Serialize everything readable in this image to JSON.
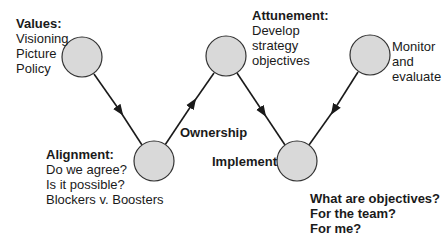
{
  "diagram": {
    "nodes": [
      {
        "id": "values",
        "title": "Values:",
        "lines": [
          "Visioning",
          "Picture",
          "Policy"
        ]
      },
      {
        "id": "alignment",
        "title": "Alignment:",
        "lines": [
          "Do we agree?",
          "Is it possible?",
          "Blockers v. Boosters"
        ]
      },
      {
        "id": "attunement",
        "title": "Attunement:",
        "lines": [
          "Develop",
          "strategy",
          "objectives"
        ]
      },
      {
        "id": "implement",
        "title": "Implement",
        "lines": []
      },
      {
        "id": "monitor",
        "title": "",
        "lines": [
          "Monitor",
          "and",
          "evaluate"
        ]
      }
    ],
    "edge_labels": {
      "ownership": "Ownership"
    },
    "questions": [
      "What are objectives?",
      "For the team?",
      "For me?"
    ],
    "colors": {
      "node_fill": "#d9d9d9",
      "node_stroke": "#333333",
      "line": "#1a1a1a"
    }
  }
}
